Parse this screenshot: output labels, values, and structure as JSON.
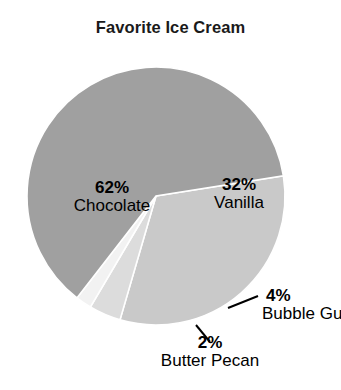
{
  "chart_data": {
    "type": "pie",
    "title": "Favorite Ice Cream",
    "categories": [
      "Chocolate",
      "Vanilla",
      "Bubble Gum",
      "Butter Pecan"
    ],
    "values": [
      62,
      32,
      4,
      2
    ],
    "unit": "%",
    "labels": [
      {
        "pct": "62%",
        "name": "Chocolate",
        "color": "#a0a0a0",
        "placement": "inside"
      },
      {
        "pct": "32%",
        "name": "Vanilla",
        "color": "#c9c9c9",
        "placement": "inside"
      },
      {
        "pct": "4%",
        "name": "Bubble Gum",
        "color": "#dcdcdc",
        "placement": "outside-leader"
      },
      {
        "pct": "2%",
        "name": "Butter Pecan",
        "color": "#f2f2f2",
        "placement": "outside-leader"
      }
    ],
    "colors": [
      "#a0a0a0",
      "#c9c9c9",
      "#dcdcdc",
      "#f2f2f2"
    ],
    "slice_border_color": "#ffffff",
    "legend": "none",
    "grid": false,
    "background": "#ffffff",
    "start_angle_deg": -9,
    "direction": "clockwise",
    "center": {
      "x": 156,
      "y": 196
    },
    "radius": 129
  }
}
